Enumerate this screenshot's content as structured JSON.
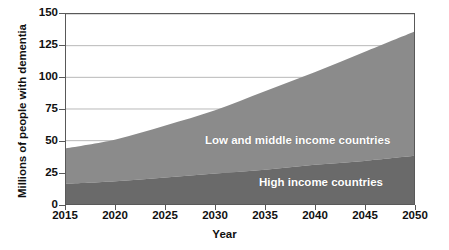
{
  "chart_data": {
    "type": "area",
    "stacked": true,
    "title": "",
    "xlabel": "Year",
    "ylabel": "Millions of people with dementia",
    "xlim": [
      2015,
      2050
    ],
    "ylim": [
      0,
      150
    ],
    "xticks": [
      "2015",
      "2020",
      "2025",
      "2030",
      "2035",
      "2040",
      "2045",
      "2050"
    ],
    "yticks": [
      "0",
      "25",
      "50",
      "75",
      "100",
      "125",
      "150"
    ],
    "grid": "horizontal",
    "legend_position": "inline-on-areas",
    "x": [
      2015,
      2020,
      2025,
      2030,
      2035,
      2040,
      2045,
      2050
    ],
    "series": [
      {
        "name": "High income countries",
        "color": "#6a6a6a",
        "values": [
          16,
          18,
          21,
          24,
          27,
          31,
          34,
          38
        ]
      },
      {
        "name": "Low and middle income countries",
        "color": "#8b8b8b",
        "values": [
          28,
          33,
          41,
          50,
          62,
          73,
          86,
          98
        ]
      }
    ],
    "totals": [
      44,
      51,
      62,
      74,
      89,
      104,
      120,
      136
    ],
    "annotations": [
      {
        "text": "Low and middle income countries",
        "series": "Low and middle income countries"
      },
      {
        "text": "High income countries",
        "series": "High income countries"
      }
    ]
  },
  "axis": {
    "y_title": "Millions of people with dementia",
    "x_title": "Year",
    "y_ticks": [
      {
        "label": "150",
        "value": 150
      },
      {
        "label": "125",
        "value": 125
      },
      {
        "label": "100",
        "value": 100
      },
      {
        "label": "75",
        "value": 75
      },
      {
        "label": "50",
        "value": 50
      },
      {
        "label": "25",
        "value": 25
      },
      {
        "label": "0",
        "value": 0
      }
    ],
    "x_ticks": [
      {
        "label": "2015",
        "value": 2015
      },
      {
        "label": "2020",
        "value": 2020
      },
      {
        "label": "2025",
        "value": 2025
      },
      {
        "label": "2030",
        "value": 2030
      },
      {
        "label": "2035",
        "value": 2035
      },
      {
        "label": "2040",
        "value": 2040
      },
      {
        "label": "2045",
        "value": 2045
      },
      {
        "label": "2050",
        "value": 2050
      }
    ]
  },
  "colors": {
    "low_middle_income": "#8b8b8b",
    "high_income": "#6a6a6a",
    "grid": "#9a9a9a",
    "frame": "#595959",
    "label_text": "#ffffff",
    "background": "#ffffff"
  }
}
